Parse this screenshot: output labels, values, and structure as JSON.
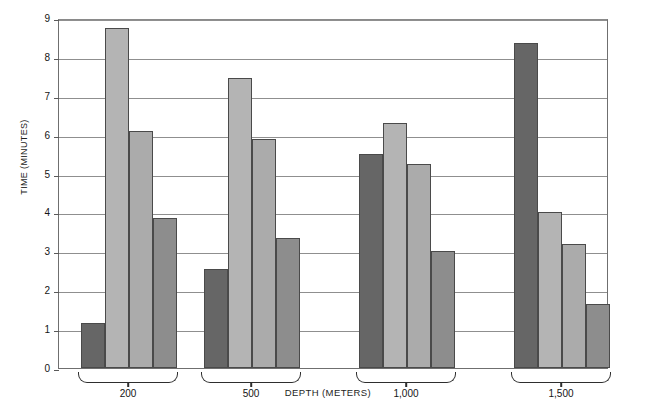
{
  "chart_data": {
    "type": "bar",
    "title": "",
    "xlabel": "DEPTH (METERS)",
    "ylabel": "TIME (MINUTES)",
    "categories": [
      "200",
      "500",
      "1,000",
      "1,500"
    ],
    "ylim": [
      0,
      9
    ],
    "ytick_labels": [
      "0",
      "1",
      "2",
      "3",
      "4",
      "5",
      "6",
      "7",
      "8",
      "9"
    ],
    "ytick_values": [
      0,
      1,
      2,
      3,
      4,
      5,
      6,
      7,
      8,
      9
    ],
    "grid": "horizontal",
    "legend": "none",
    "grouped": true,
    "bars_per_group": 4,
    "series": [
      {
        "name": "series-1",
        "color": "#666666",
        "values": [
          1.15,
          2.55,
          5.5,
          8.35
        ]
      },
      {
        "name": "series-2",
        "color": "#b4b4b4",
        "values": [
          8.75,
          7.45,
          6.3,
          4.0
        ]
      },
      {
        "name": "series-3",
        "color": "#ababab",
        "values": [
          6.1,
          5.9,
          5.25,
          3.2
        ]
      },
      {
        "name": "series-4",
        "color": "#8d8d8d",
        "values": [
          3.85,
          3.35,
          3.0,
          1.65
        ]
      }
    ]
  },
  "axes": {
    "y_title": "TIME (MINUTES)",
    "x_title": "DEPTH (METERS)"
  },
  "layout": {
    "plot_left": 58,
    "plot_top": 19,
    "plot_width": 550,
    "plot_height": 350,
    "group_starts": [
      22,
      145,
      300,
      455
    ],
    "bar_width": 24,
    "frame_color": "#6f6f6f",
    "grid_color": "#8f8f8f"
  }
}
